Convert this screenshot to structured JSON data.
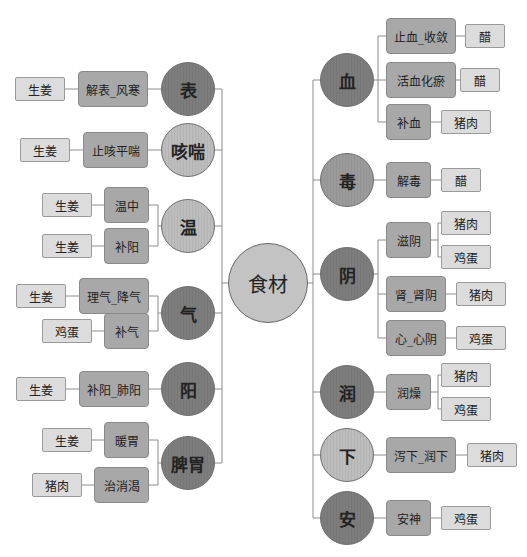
{
  "root": {
    "label": "食材",
    "color": "#c3c3c3"
  },
  "colors": {
    "dark": "#7d7d7d",
    "medium": "#9b9b9b",
    "light": "#bdbdbd",
    "level2": "#a8a8a8",
    "level3": "#dcdcdc",
    "line": "#8c8c8c"
  },
  "left": [
    {
      "label": "表",
      "tone": "dark",
      "children": [
        {
          "label": "解表_风寒",
          "foods": [
            "生姜"
          ]
        }
      ]
    },
    {
      "label": "咳喘",
      "tone": "light",
      "children": [
        {
          "label": "止咳平喘",
          "foods": [
            "生姜"
          ]
        }
      ]
    },
    {
      "label": "温",
      "tone": "light",
      "children": [
        {
          "label": "温中",
          "foods": [
            "生姜"
          ]
        },
        {
          "label": "补阳",
          "foods": [
            "生姜"
          ]
        }
      ]
    },
    {
      "label": "气",
      "tone": "dark",
      "children": [
        {
          "label": "理气_降气",
          "foods": [
            "生姜"
          ]
        },
        {
          "label": "补气",
          "foods": [
            "鸡蛋"
          ]
        }
      ]
    },
    {
      "label": "阳",
      "tone": "dark",
      "children": [
        {
          "label": "补阳_肺阳",
          "foods": [
            "生姜"
          ]
        }
      ]
    },
    {
      "label": "脾胃",
      "tone": "dark",
      "children": [
        {
          "label": "暖胃",
          "foods": [
            "生姜"
          ]
        },
        {
          "label": "治消渴",
          "foods": [
            "猪肉"
          ]
        }
      ]
    }
  ],
  "right": [
    {
      "label": "血",
      "tone": "dark",
      "children": [
        {
          "label": "止血_收敛",
          "foods": [
            "醋"
          ]
        },
        {
          "label": "活血化瘀",
          "foods": [
            "醋"
          ]
        },
        {
          "label": "补血",
          "foods": [
            "猪肉"
          ]
        }
      ]
    },
    {
      "label": "毒",
      "tone": "medium",
      "children": [
        {
          "label": "解毒",
          "foods": [
            "醋"
          ]
        }
      ]
    },
    {
      "label": "阴",
      "tone": "dark",
      "children": [
        {
          "label": "滋阴",
          "foods": [
            "猪肉",
            "鸡蛋"
          ]
        },
        {
          "label": "肾_肾阴",
          "foods": [
            "猪肉"
          ]
        },
        {
          "label": "心_心阴",
          "foods": [
            "鸡蛋"
          ]
        }
      ]
    },
    {
      "label": "润",
      "tone": "dark",
      "children": [
        {
          "label": "润燥",
          "foods": [
            "猪肉",
            "鸡蛋"
          ]
        }
      ]
    },
    {
      "label": "下",
      "tone": "light",
      "children": [
        {
          "label": "泻下_润下",
          "foods": [
            "猪肉"
          ]
        }
      ]
    },
    {
      "label": "安",
      "tone": "dark",
      "children": [
        {
          "label": "安神",
          "foods": [
            "鸡蛋"
          ]
        }
      ]
    }
  ]
}
